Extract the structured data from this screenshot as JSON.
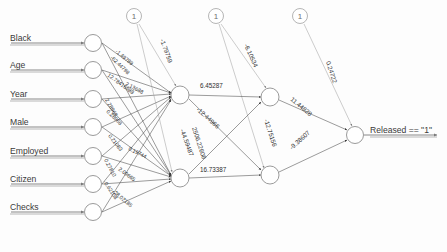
{
  "diagram": {
    "background_color": "#fdfdfd",
    "node_stroke_color": "#8e8e8e",
    "edge_color": "#4a4a4a",
    "text_color": "#3a3a3a"
  },
  "inputs": [
    {
      "label": "Black",
      "cx": 93,
      "cy": 43,
      "label_x": 10,
      "label_y": 38
    },
    {
      "label": "Age",
      "cx": 93,
      "cy": 70,
      "label_x": 10,
      "label_y": 66
    },
    {
      "label": "Year",
      "cx": 93,
      "cy": 99,
      "label_x": 10,
      "label_y": 94
    },
    {
      "label": "Male",
      "cx": 93,
      "cy": 127,
      "label_x": 10,
      "label_y": 123
    },
    {
      "label": "Employed",
      "cx": 93,
      "cy": 156,
      "label_x": 10,
      "label_y": 151
    },
    {
      "label": "Citizen",
      "cx": 93,
      "cy": 184,
      "label_x": 10,
      "label_y": 180
    },
    {
      "label": "Checks",
      "cx": 93,
      "cy": 212,
      "label_x": 10,
      "label_y": 208
    }
  ],
  "hidden_layer_1": [
    {
      "id": "h1a",
      "cx": 180,
      "cy": 95
    },
    {
      "id": "h1b",
      "cx": 180,
      "cy": 178
    }
  ],
  "hidden_layer_2": [
    {
      "id": "h2a",
      "cx": 270,
      "cy": 97
    },
    {
      "id": "h2b",
      "cx": 270,
      "cy": 175
    }
  ],
  "output": {
    "id": "out",
    "cx": 355,
    "cy": 135,
    "label": "Released == \"1\"",
    "label_x": 370,
    "label_y": 130
  },
  "bias_nodes": [
    {
      "label": "1",
      "cx": 134,
      "cy": 16
    },
    {
      "label": "1",
      "cx": 216,
      "cy": 16
    },
    {
      "label": "1",
      "cx": 300,
      "cy": 16
    }
  ],
  "weights": {
    "bias_to_h1a": "-1.79759",
    "bias_to_h2a": "-6.10534",
    "bias_to_out": "0.24722",
    "h1a_to_h2a": "6.45287",
    "h1a_to_h2b": "-12.44966",
    "h1b_to_h2a": "-44.59487",
    "h1b_to_h2b": "16.73387",
    "h1b_cross": "2506.22608",
    "h2a_to_out": "11.44828",
    "h2b_to_out": "-9.38607",
    "h2_cross": "-12.75156",
    "input_cluster": [
      "-1.49789",
      "-62.44798",
      "12.78416988",
      "2.13688",
      "0.28968",
      "0.21083",
      "0.27810",
      "0.19744",
      "2.09665",
      "-0.62108",
      "-28.02185"
    ]
  },
  "input_edge_labels": [
    {
      "text": "-1.49789",
      "x": 115,
      "y": 52,
      "rotate": 40
    },
    {
      "text": "-62.44798",
      "x": 110,
      "y": 58,
      "rotate": 44
    },
    {
      "text": "12.78416988",
      "x": 107,
      "y": 76,
      "rotate": 36
    },
    {
      "text": "2.13688",
      "x": 125,
      "y": 85,
      "rotate": 28
    },
    {
      "text": "2.28968",
      "x": 105,
      "y": 100,
      "rotate": 60
    },
    {
      "text": "0.28968",
      "x": 106,
      "y": 112,
      "rotate": 44
    },
    {
      "text": "0.21083",
      "x": 108,
      "y": 136,
      "rotate": 52
    },
    {
      "text": "0.19744",
      "x": 128,
      "y": 150,
      "rotate": 26
    },
    {
      "text": "0.27810",
      "x": 104,
      "y": 160,
      "rotate": 62
    },
    {
      "text": "2.09665",
      "x": 118,
      "y": 170,
      "rotate": 36
    },
    {
      "text": "-0.62108",
      "x": 103,
      "y": 182,
      "rotate": 56
    },
    {
      "text": "-28.02185",
      "x": 112,
      "y": 192,
      "rotate": 40
    }
  ]
}
